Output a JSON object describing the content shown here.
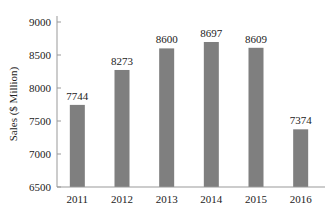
{
  "chart_data": {
    "type": "bar",
    "title": "",
    "xlabel": "",
    "ylabel": "Sales ($ Million)",
    "categories": [
      "2011",
      "2012",
      "2013",
      "2014",
      "2015",
      "2016"
    ],
    "values": [
      7744,
      8273,
      8600,
      8697,
      8609,
      7374
    ],
    "data_labels": [
      "7744",
      "8273",
      "8600",
      "8697",
      "8609",
      "7374"
    ],
    "ylim": [
      6500,
      9000
    ],
    "yticks": [
      6500,
      7000,
      7500,
      8000,
      8500,
      9000
    ],
    "ytick_labels": [
      "6500",
      "7000",
      "7500",
      "8000",
      "8500",
      "9000"
    ],
    "grid": false,
    "legend": null,
    "bar_color": "#7f7f7f"
  }
}
